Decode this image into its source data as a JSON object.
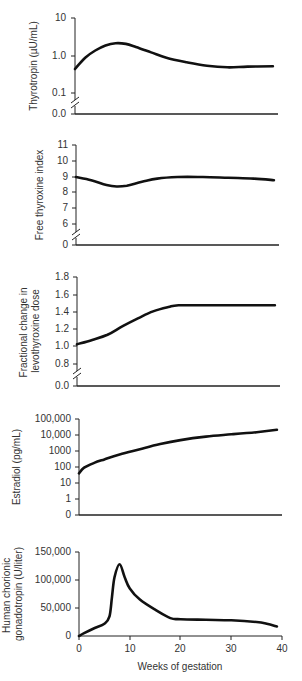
{
  "figure": {
    "x_axis_title": "Weeks of gestation",
    "x_ticks": [
      "0",
      "10",
      "20",
      "30",
      "40"
    ]
  },
  "chart_data": [
    {
      "type": "line",
      "title": "",
      "ylabel": "Thyrotropin (µU/mL)",
      "xlabel": "",
      "yscale": "log",
      "y_ticks": [
        "10",
        "1.0",
        "0.1",
        "0.0"
      ],
      "axis_break": true,
      "xlim": [
        0,
        40
      ],
      "x": [
        0,
        2,
        4,
        6,
        8,
        10,
        12,
        15,
        18,
        22,
        26,
        30,
        34,
        39
      ],
      "values": [
        0.45,
        0.9,
        1.4,
        1.9,
        2.2,
        2.1,
        1.75,
        1.25,
        0.9,
        0.68,
        0.55,
        0.5,
        0.52,
        0.53
      ]
    },
    {
      "type": "line",
      "title": "",
      "ylabel": "Free thyroxine index",
      "xlabel": "",
      "y_ticks": [
        "11",
        "10",
        "9",
        "8",
        "7",
        "6",
        "0"
      ],
      "axis_break": true,
      "xlim": [
        0,
        40
      ],
      "x": [
        0,
        3,
        6,
        8,
        10,
        13,
        16,
        20,
        25,
        30,
        35,
        39
      ],
      "values": [
        9.0,
        8.8,
        8.5,
        8.4,
        8.45,
        8.7,
        8.9,
        9.0,
        9.0,
        8.95,
        8.9,
        8.8
      ]
    },
    {
      "type": "line",
      "title": "",
      "ylabel": "Fractional change in levothyroxine dose",
      "xlabel": "",
      "y_ticks": [
        "1.8",
        "1.6",
        "1.4",
        "1.2",
        "1.0",
        "0.8",
        "0.0"
      ],
      "axis_break": true,
      "xlim": [
        0,
        40
      ],
      "x": [
        0,
        3,
        6,
        9,
        12,
        15,
        18,
        20,
        25,
        30,
        35,
        39
      ],
      "values": [
        1.02,
        1.07,
        1.13,
        1.23,
        1.32,
        1.4,
        1.45,
        1.47,
        1.47,
        1.47,
        1.47,
        1.47
      ]
    },
    {
      "type": "line",
      "title": "",
      "ylabel": "Estradiol (pg/mL)",
      "xlabel": "",
      "yscale": "log",
      "y_ticks": [
        "100,000",
        "10,000",
        "1000",
        "100",
        "10",
        "1",
        "0"
      ],
      "xlim": [
        0,
        40
      ],
      "x": [
        0,
        1,
        3,
        5,
        8,
        12,
        16,
        20,
        25,
        30,
        35,
        39
      ],
      "values": [
        40,
        90,
        180,
        300,
        600,
        1300,
        2700,
        4800,
        8000,
        11000,
        15000,
        21000
      ]
    },
    {
      "type": "line",
      "title": "",
      "ylabel": "Human chorionic gonadotropin (U/liter)",
      "xlabel": "Weeks of gestation",
      "y_ticks": [
        "150,000",
        "100,000",
        "50,000",
        "0"
      ],
      "x_ticks": [
        "0",
        "10",
        "20",
        "30",
        "40"
      ],
      "xlim": [
        0,
        40
      ],
      "ylim": [
        0,
        150000
      ],
      "x": [
        0,
        1,
        3,
        5,
        6,
        6.5,
        7,
        8,
        9,
        10,
        12,
        15,
        18,
        20,
        25,
        30,
        35,
        37,
        39
      ],
      "values": [
        0,
        5000,
        14000,
        22000,
        35000,
        70000,
        105000,
        128000,
        105000,
        85000,
        65000,
        47000,
        32000,
        30000,
        29000,
        28000,
        25000,
        22000,
        17000
      ]
    }
  ]
}
